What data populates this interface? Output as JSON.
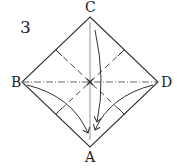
{
  "diagram": {
    "type": "origami-fold-diagram",
    "step_number": "3",
    "vertices": {
      "top": "C",
      "left": "B",
      "right": "D",
      "bottom": "A"
    },
    "lines": {
      "outline": "square rotated 45deg (diamond)",
      "mountain_fold": "horizontal B–D (dash-dot)",
      "valley_folds": "dashed diagonals through center",
      "crease_vertical": "thin solid C–A",
      "arrows": "B, C, D folded down to A"
    },
    "colors": {
      "line": "#333333",
      "background": "#ffffff"
    }
  }
}
